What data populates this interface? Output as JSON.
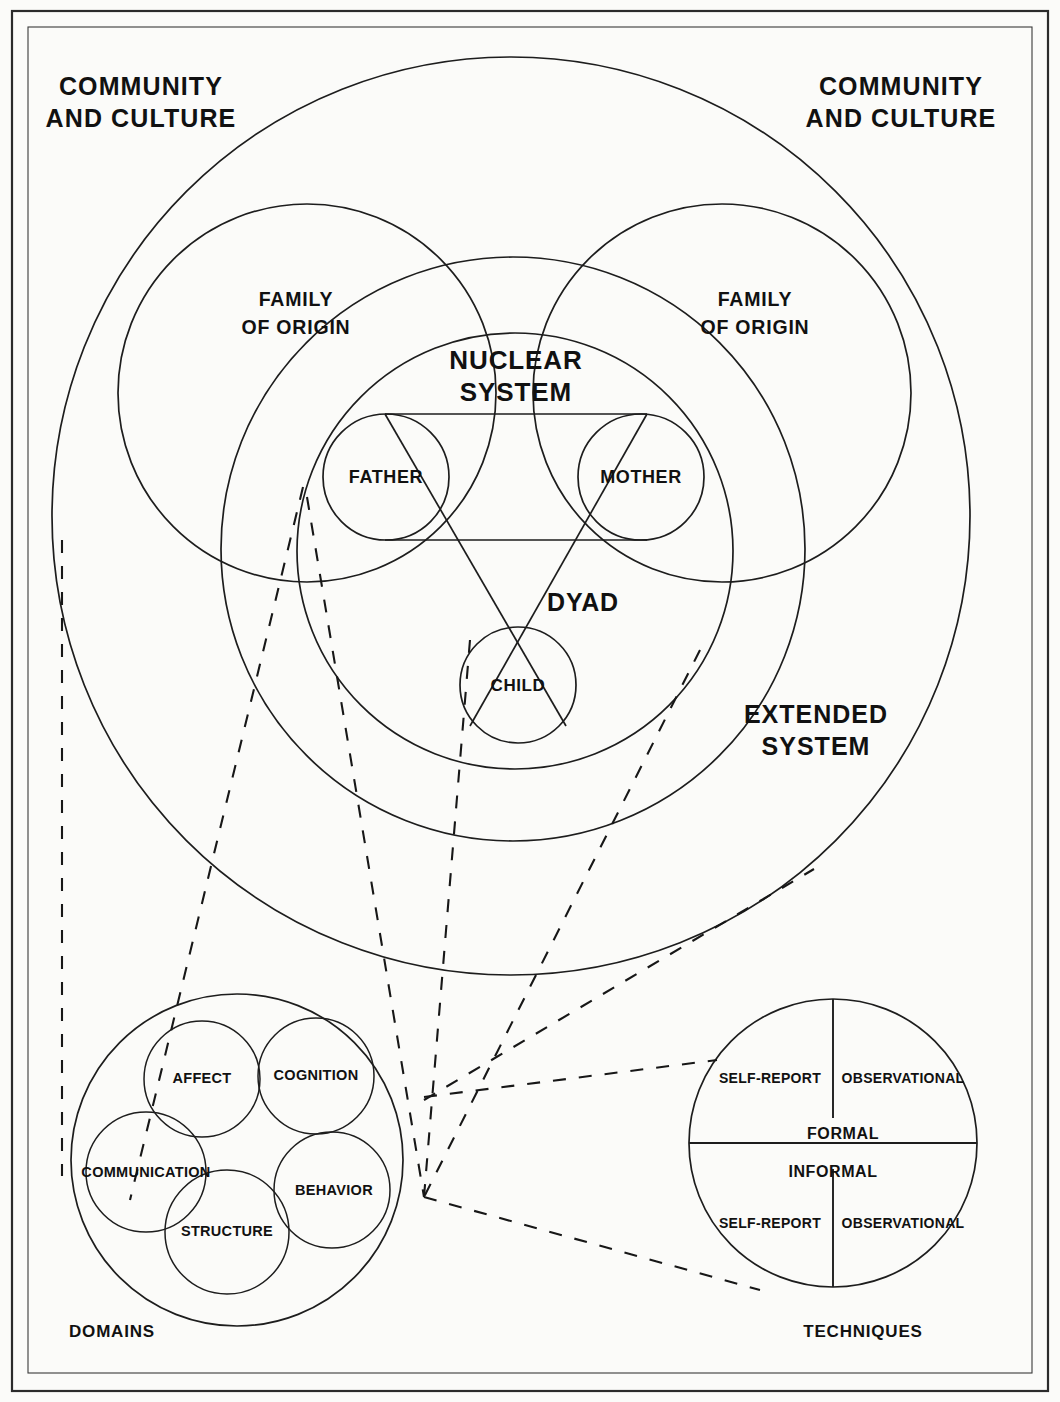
{
  "figure": {
    "type": "concentric-venn-systems-diagram",
    "background": "#fbfbf9",
    "ink": "#1d1d1d"
  },
  "outer_labels": {
    "community_left_line1": "COMMUNITY",
    "community_left_line2": "AND CULTURE",
    "community_right_line1": "COMMUNITY",
    "community_right_line2": "AND CULTURE",
    "extended_line1": "EXTENDED",
    "extended_line2": "SYSTEM"
  },
  "family_of_origin": {
    "left_line1": "FAMILY",
    "left_line2": "OF ORIGIN",
    "right_line1": "FAMILY",
    "right_line2": "OF ORIGIN"
  },
  "nuclear_system": {
    "title_line1": "NUCLEAR",
    "title_line2": "SYSTEM",
    "dyad_label": "DYAD",
    "members": [
      {
        "label": "FATHER"
      },
      {
        "label": "MOTHER"
      },
      {
        "label": "CHILD"
      }
    ]
  },
  "domains": {
    "caption": "DOMAINS",
    "items": [
      {
        "label": "AFFECT"
      },
      {
        "label": "COGNITION"
      },
      {
        "label": "COMMUNICATION"
      },
      {
        "label": "STRUCTURE"
      },
      {
        "label": "BEHAVIOR"
      }
    ]
  },
  "techniques": {
    "caption": "TECHNIQUES",
    "bands": [
      {
        "label": "FORMAL"
      },
      {
        "label": "INFORMAL"
      }
    ],
    "quadrants": [
      {
        "label": "SELF-REPORT",
        "band": "FORMAL",
        "side": "left"
      },
      {
        "label": "OBSERVATIONAL",
        "band": "FORMAL",
        "side": "right"
      },
      {
        "label": "SELF-REPORT",
        "band": "INFORMAL",
        "side": "left"
      },
      {
        "label": "OBSERVATIONAL",
        "band": "INFORMAL",
        "side": "right"
      }
    ]
  }
}
